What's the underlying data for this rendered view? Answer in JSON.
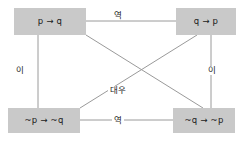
{
  "diagram": {
    "background_color": "#ffffff",
    "node_fill_color": "#c9c9c9",
    "edge_color": "#9a9a9a",
    "text_color": "#1a1a1a",
    "nodes": {
      "top_left": "p → q",
      "top_right": "q → p",
      "bottom_left": "~p → ~q",
      "bottom_right": "~q → ~p"
    },
    "edge_labels": {
      "top": "역",
      "bottom": "역",
      "left": "이",
      "right": "이",
      "center": "대우"
    }
  }
}
